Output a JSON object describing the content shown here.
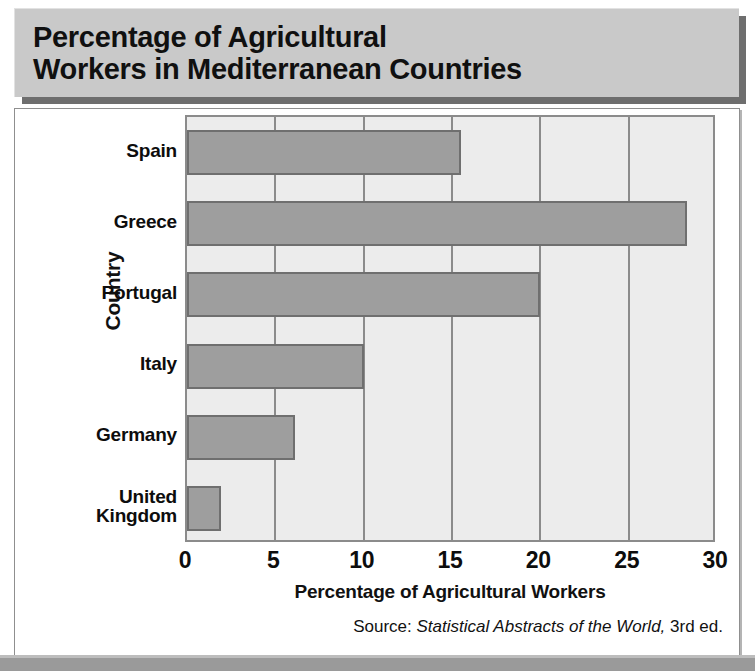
{
  "title": {
    "line1": "Percentage of Agricultural",
    "line2": "Workers in Mediterranean Countries"
  },
  "source": {
    "prefix": "Source:",
    "work": "Statistical Abstracts of the World,",
    "suffix": "3rd ed."
  },
  "colors": {
    "title_plate": "#c9c9c9",
    "plot_background": "#ececec",
    "bar_fill": "#9e9e9e",
    "bar_border": "#6f6f6f",
    "gridline": "#8b8b8b",
    "page_band": "#9a9a9a"
  },
  "chart_data": {
    "type": "bar",
    "orientation": "horizontal",
    "title": "Percentage of Agricultural Workers in Mediterranean Countries",
    "categories": [
      "Spain",
      "Greece",
      "Portugal",
      "Italy",
      "Germany",
      "United Kingdom"
    ],
    "values": [
      15.5,
      28.3,
      20.0,
      10.0,
      6.1,
      1.9
    ],
    "xlabel": "Percentage of Agricultural Workers",
    "ylabel": "Country",
    "xlim": [
      0,
      30
    ],
    "xticks": [
      0,
      5,
      10,
      15,
      20,
      25,
      30
    ],
    "xtick_labels": [
      "0",
      "5",
      "10",
      "15",
      "20",
      "25",
      "30"
    ],
    "grid": true,
    "grid_axis": "x",
    "legend": false
  }
}
